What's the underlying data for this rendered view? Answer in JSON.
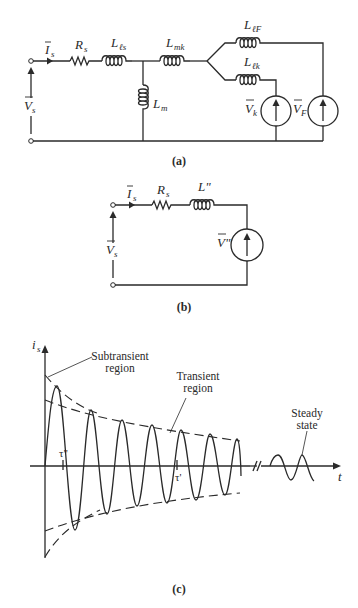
{
  "figure": {
    "panels": [
      {
        "id": "a",
        "caption": "(a)",
        "labels": {
          "current": {
            "main": "I",
            "sub": "s"
          },
          "voltage": {
            "main": "V",
            "sub": "s"
          },
          "resistor": {
            "main": "R",
            "sub": "s"
          },
          "leakage_stator": {
            "main": "L",
            "sub": "ℓs"
          },
          "magnetizing": {
            "main": "L",
            "sub": "m"
          },
          "mutual_k": {
            "main": "L",
            "sub": "mk"
          },
          "leakage_field": {
            "main": "L",
            "sub": "ℓF"
          },
          "leakage_k": {
            "main": "L",
            "sub": "ℓk"
          },
          "source_k": {
            "main": "V",
            "sub": "k"
          },
          "source_field": {
            "main": "V",
            "sub": "F"
          }
        }
      },
      {
        "id": "b",
        "caption": "(b)",
        "labels": {
          "current": {
            "main": "I",
            "sub": "s"
          },
          "voltage": {
            "main": "V",
            "sub": "s"
          },
          "resistor": {
            "main": "R",
            "sub": "s"
          },
          "inductor": "L\"",
          "source": "V\""
        }
      },
      {
        "id": "c",
        "caption": "(c)",
        "axes": {
          "y_label": {
            "main": "i",
            "sub": "s"
          },
          "x_label": "t"
        },
        "annotations": {
          "subtransient": [
            "Subtransient",
            "region"
          ],
          "transient": [
            "Transient",
            "region"
          ],
          "steady": [
            "Steady",
            "state"
          ],
          "tau_subtransient": "τ\"",
          "tau_transient": "τ'"
        }
      }
    ]
  }
}
